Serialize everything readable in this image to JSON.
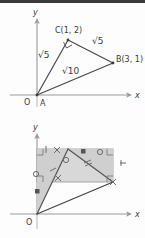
{
  "figure": {
    "panels": [
      {
        "id": "top",
        "name": "triangle-with-side-lengths",
        "axis": {
          "x_label": "x",
          "y_label": "y",
          "origin_label": "O"
        },
        "points": [
          {
            "name": "A",
            "label": "A",
            "x": 0,
            "y": 0
          },
          {
            "name": "B",
            "label": "B(3, 1)",
            "x": 3,
            "y": 1
          },
          {
            "name": "C",
            "label": "C(1, 2)",
            "x": 1,
            "y": 2
          }
        ],
        "side_labels": [
          {
            "name": "AC",
            "label": "√5"
          },
          {
            "name": "CB",
            "label": "√5"
          },
          {
            "name": "AB",
            "label": "√10"
          }
        ],
        "marks": [
          {
            "name": "right-angle-at-C",
            "label": "right angle"
          }
        ]
      },
      {
        "id": "bottom",
        "name": "triangle-in-bounding-rectangle",
        "axis": {
          "x_label": "x",
          "y_label": "y",
          "origin_label": "O"
        },
        "shaded_region": {
          "name": "bounding-rectangle",
          "fill": "#d8d8d8"
        },
        "congruence_marks": [
          {
            "name": "cross-mark",
            "glyph": "×"
          },
          {
            "name": "circle-mark",
            "glyph": "○"
          },
          {
            "name": "square-mark",
            "glyph": "■"
          },
          {
            "name": "tick-mark",
            "glyph": "/"
          }
        ],
        "right_angle_corners": 4
      }
    ],
    "colors": {
      "ink": "#3b3b3b",
      "axis": "#8a8a8a",
      "shade": "#d8d8d8",
      "topbar": "#3a3a3a"
    }
  }
}
